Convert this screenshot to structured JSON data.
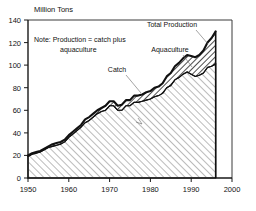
{
  "chart_data": {
    "type": "area",
    "title": "",
    "xlabel": "",
    "ylabel": "Million Tons",
    "xlim": [
      1950,
      2000
    ],
    "ylim": [
      0,
      140
    ],
    "xticks": [
      1950,
      1960,
      1970,
      1980,
      1990,
      2000
    ],
    "yticks": [
      0,
      20,
      40,
      60,
      80,
      100,
      120,
      140
    ],
    "grid": false,
    "legend_position": "inline-annotations",
    "annotations": [
      {
        "name": "note",
        "text": "Note: Production = catch plus aquaculture"
      },
      {
        "name": "total-production-label",
        "text": "Total Production"
      },
      {
        "name": "aquaculture-label",
        "text": "Aquaculture"
      },
      {
        "name": "catch-label",
        "text": "Catch"
      }
    ],
    "x": [
      1950,
      1951,
      1952,
      1953,
      1954,
      1955,
      1956,
      1957,
      1958,
      1959,
      1960,
      1961,
      1962,
      1963,
      1964,
      1965,
      1966,
      1967,
      1968,
      1969,
      1970,
      1971,
      1972,
      1973,
      1974,
      1975,
      1976,
      1977,
      1978,
      1979,
      1980,
      1981,
      1982,
      1983,
      1984,
      1985,
      1986,
      1987,
      1988,
      1989,
      1990,
      1991,
      1992,
      1993,
      1994,
      1995,
      1996
    ],
    "series": [
      {
        "name": "Catch",
        "values": [
          19,
          21,
          22,
          23,
          25,
          27,
          28,
          29,
          30,
          32,
          36,
          39,
          42,
          45,
          49,
          51,
          54,
          57,
          59,
          60,
          64,
          64,
          60,
          60,
          64,
          64,
          67,
          67,
          68,
          69,
          70,
          72,
          73,
          75,
          80,
          82,
          87,
          89,
          92,
          94,
          92,
          90,
          91,
          93,
          98,
          99,
          101
        ]
      },
      {
        "name": "Aquaculture",
        "values": [
          1,
          1,
          1,
          1,
          1,
          1,
          2,
          2,
          2,
          2,
          2,
          2,
          2,
          2,
          3,
          3,
          3,
          3,
          3,
          4,
          4,
          4,
          4,
          5,
          5,
          5,
          6,
          6,
          6,
          7,
          7,
          8,
          8,
          9,
          10,
          11,
          12,
          13,
          14,
          15,
          16,
          17,
          18,
          20,
          22,
          25,
          29
        ]
      },
      {
        "name": "Total Production",
        "values": [
          20,
          22,
          23,
          24,
          26,
          28,
          30,
          31,
          32,
          34,
          38,
          41,
          44,
          47,
          52,
          54,
          57,
          60,
          62,
          64,
          68,
          68,
          64,
          65,
          69,
          69,
          73,
          73,
          74,
          76,
          77,
          80,
          81,
          84,
          90,
          93,
          99,
          102,
          106,
          109,
          108,
          107,
          109,
          113,
          120,
          124,
          130
        ]
      }
    ]
  }
}
